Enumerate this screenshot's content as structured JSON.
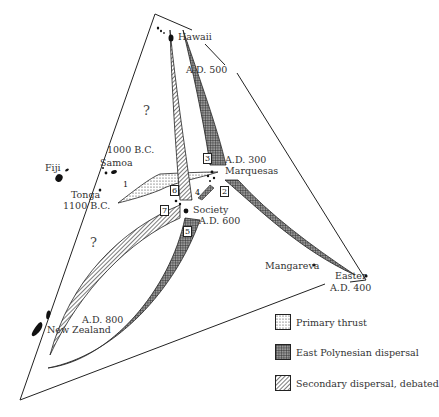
{
  "diagram": {
    "places": {
      "hawaii": {
        "name": "Hawaii"
      },
      "hawaii_date": {
        "name": "A.D. 500"
      },
      "fiji": {
        "name": "Fiji"
      },
      "samoa_date": {
        "name": "1000 B.C."
      },
      "samoa": {
        "name": "Samoa"
      },
      "tonga": {
        "name": "Tonga"
      },
      "tonga_date": {
        "name": "1100 B.C."
      },
      "marquesas_date": {
        "name": "A.D. 300"
      },
      "marquesas": {
        "name": "Marquesas"
      },
      "society": {
        "name": "Society"
      },
      "society_date": {
        "name": "A.D. 600"
      },
      "mangareva": {
        "name": "Mangareva"
      },
      "easter": {
        "name": "Easter"
      },
      "easter_date": {
        "name": "A.D. 400"
      },
      "nz_date": {
        "name": "A.D. 800"
      },
      "new_zealand": {
        "name": "New Zealand"
      }
    },
    "route_numbers": [
      "1",
      "2",
      "3",
      "4",
      "5",
      "6",
      "7"
    ],
    "uncertain_marker": "?",
    "legend": [
      {
        "label": "Primary thrust",
        "pattern": "dots"
      },
      {
        "label": "East Polynesian dispersal",
        "pattern": "grid"
      },
      {
        "label": "Secondary dispersal, debated",
        "pattern": "diagonal"
      }
    ]
  }
}
